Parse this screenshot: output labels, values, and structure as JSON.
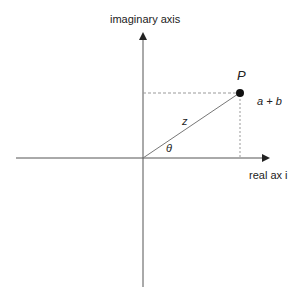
{
  "diagram": {
    "y_axis_label": "imaginary axis",
    "x_axis_label": "real ax i",
    "point_label": "P",
    "point_value": "a + b",
    "vector_label": "z",
    "angle_label": "θ",
    "colors": {
      "axis": "#555555",
      "vector": "#777777",
      "dashed": "#999999",
      "point": "#111111",
      "text": "#222222"
    }
  }
}
